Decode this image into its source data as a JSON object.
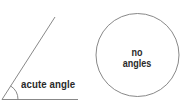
{
  "diagram": {
    "left_figure": {
      "label": "acute angle",
      "vertex": [
        2,
        99
      ],
      "baseline_end": [
        78,
        99
      ],
      "ray_end": [
        55,
        17
      ],
      "arc_radius": 16
    },
    "right_figure": {
      "label_line1": "no",
      "label_line2": "angles",
      "circle_center": [
        137.5,
        55
      ],
      "circle_radius": 41.5
    },
    "stroke_color": "#7a7a7a",
    "text_color": "#2a2a2a"
  }
}
